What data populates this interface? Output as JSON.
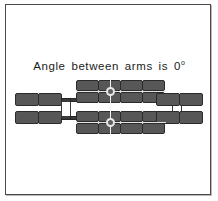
{
  "figure": {
    "caption_text": "Angle between arms is 0",
    "caption_degree_symbol": "o",
    "caption_full": "Angle between arms is 0°",
    "angle_value": "0",
    "angle_unit": "degrees",
    "background_color": "#ffffff",
    "border_color": "#4a4a4a",
    "block_fill_color": "#575757",
    "block_edge_color": "#2b2b2b",
    "joint_highlight_color": "#e9e9e9",
    "link_color": "#3a3a3a"
  },
  "mechanism": {
    "name": "dual-arm-linkage",
    "core": {
      "name": "central-body",
      "rows": 4,
      "columns": 4,
      "block_count": 16
    },
    "left_arm": {
      "name": "left-arm",
      "rows": 2,
      "columns": 2,
      "block_count": 4
    },
    "right_arm": {
      "name": "right-arm",
      "rows": 2,
      "columns": 2,
      "block_count": 4
    },
    "joints": [
      {
        "name": "upper-revolute-joint",
        "index": "1"
      },
      {
        "name": "lower-revolute-joint",
        "index": "2"
      }
    ],
    "connectors": [
      {
        "name": "left-connector-link"
      },
      {
        "name": "right-connector-link"
      }
    ]
  }
}
